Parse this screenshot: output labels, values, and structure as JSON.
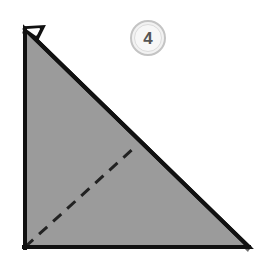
{
  "figure": {
    "step_badge": {
      "number": "4",
      "shape": "circle",
      "fill_color": "#f2f2f2",
      "border_color": "#c4c4c4",
      "text_color": "#555555"
    },
    "background_color": "#ffffff",
    "paper": {
      "name": "folded-paper-triangle",
      "fill_color": "#9a9a9a",
      "outline_color": "#111111",
      "shadow_band_color": "#6a6a6a",
      "outline_width": 4,
      "shape": "right-triangle",
      "vertices": [
        {
          "label": "top-left-apex",
          "x": 24,
          "y": 28
        },
        {
          "label": "bottom-right",
          "x": 250,
          "y": 248
        },
        {
          "label": "bottom-left",
          "x": 24,
          "y": 248
        }
      ]
    },
    "flap_notch": {
      "name": "corner-flap-notch",
      "description": "small folded flap notch at top-left apex",
      "points": [
        {
          "x": 24,
          "y": 28
        },
        {
          "x": 42,
          "y": 27
        },
        {
          "x": 36,
          "y": 38
        },
        {
          "x": 30,
          "y": 31
        }
      ]
    },
    "fold_line": {
      "name": "valley-fold-dashed-line",
      "style": "dashed",
      "color": "#222222",
      "width": 3,
      "dash_pattern": "11 8",
      "start": {
        "x": 25,
        "y": 247
      },
      "end": {
        "x": 135,
        "y": 147
      }
    },
    "shadow_band": {
      "name": "hypotenuse-layer-shadow",
      "description": "darker gray band showing underlying paper layer along the hypotenuse"
    }
  }
}
